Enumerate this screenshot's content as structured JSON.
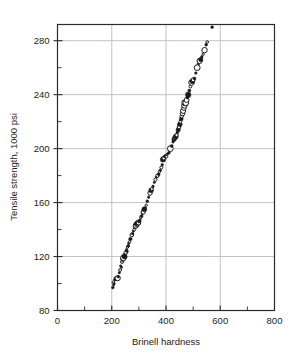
{
  "chart_data": {
    "type": "scatter",
    "title": "",
    "xlabel": "Brinell hardness",
    "ylabel": "Tensile strength, 1000 psi",
    "xlim": [
      0,
      800
    ],
    "ylim": [
      80,
      292
    ],
    "x_major_ticks": [
      0,
      200,
      400,
      600,
      800
    ],
    "x_tick_labels": [
      "0",
      "200",
      "400",
      "600",
      "800"
    ],
    "x_minor_step": 100,
    "y_major_ticks": [
      80,
      120,
      160,
      200,
      240,
      280
    ],
    "y_tick_labels": [
      "80",
      "120",
      "160",
      "200",
      "240",
      "280"
    ],
    "y_minor_step": 20,
    "grid": "major-both",
    "grid_color": "#b9bcc4",
    "frame_color": "#2b2b2b",
    "marker_color": "#1a1a1a",
    "legend": "none",
    "points": [
      {
        "x": 204,
        "y": 97,
        "r": 1.4,
        "filled": true
      },
      {
        "x": 207,
        "y": 99,
        "r": 1.2,
        "filled": true
      },
      {
        "x": 206,
        "y": 101,
        "r": 1.3,
        "filled": false
      },
      {
        "x": 209,
        "y": 100,
        "r": 1.1,
        "filled": true
      },
      {
        "x": 212,
        "y": 103,
        "r": 1.5,
        "filled": true
      },
      {
        "x": 214,
        "y": 104,
        "r": 1.2,
        "filled": false
      },
      {
        "x": 218,
        "y": 103,
        "r": 1.2,
        "filled": true
      },
      {
        "x": 222,
        "y": 104,
        "r": 2.6,
        "filled": false
      },
      {
        "x": 224,
        "y": 105,
        "r": 1.3,
        "filled": true
      },
      {
        "x": 228,
        "y": 108,
        "r": 1.2,
        "filled": true
      },
      {
        "x": 231,
        "y": 110,
        "r": 1.4,
        "filled": false
      },
      {
        "x": 233,
        "y": 113,
        "r": 1.2,
        "filled": true
      },
      {
        "x": 236,
        "y": 112,
        "r": 1.1,
        "filled": true
      },
      {
        "x": 238,
        "y": 116,
        "r": 1.5,
        "filled": false
      },
      {
        "x": 241,
        "y": 118,
        "r": 2.3,
        "filled": true
      },
      {
        "x": 243,
        "y": 119,
        "r": 2.8,
        "filled": false
      },
      {
        "x": 245,
        "y": 120,
        "r": 2.1,
        "filled": true
      },
      {
        "x": 246,
        "y": 121,
        "r": 1.6,
        "filled": false
      },
      {
        "x": 248,
        "y": 120,
        "r": 2.4,
        "filled": true
      },
      {
        "x": 250,
        "y": 122,
        "r": 1.3,
        "filled": true
      },
      {
        "x": 252,
        "y": 123,
        "r": 1.8,
        "filled": false
      },
      {
        "x": 254,
        "y": 125,
        "r": 1.2,
        "filled": true
      },
      {
        "x": 256,
        "y": 124,
        "r": 1.4,
        "filled": true
      },
      {
        "x": 258,
        "y": 127,
        "r": 1.2,
        "filled": false
      },
      {
        "x": 261,
        "y": 128,
        "r": 1.5,
        "filled": true
      },
      {
        "x": 263,
        "y": 130,
        "r": 1.3,
        "filled": true
      },
      {
        "x": 266,
        "y": 131,
        "r": 1.2,
        "filled": false
      },
      {
        "x": 268,
        "y": 133,
        "r": 1.6,
        "filled": true
      },
      {
        "x": 271,
        "y": 133,
        "r": 1.2,
        "filled": true
      },
      {
        "x": 274,
        "y": 136,
        "r": 1.8,
        "filled": false
      },
      {
        "x": 277,
        "y": 137,
        "r": 1.3,
        "filled": true
      },
      {
        "x": 280,
        "y": 139,
        "r": 1.2,
        "filled": true
      },
      {
        "x": 283,
        "y": 140,
        "r": 1.4,
        "filled": false
      },
      {
        "x": 286,
        "y": 142,
        "r": 2.0,
        "filled": true
      },
      {
        "x": 289,
        "y": 143,
        "r": 2.7,
        "filled": false
      },
      {
        "x": 291,
        "y": 144,
        "r": 2.4,
        "filled": true
      },
      {
        "x": 294,
        "y": 144,
        "r": 1.9,
        "filled": false
      },
      {
        "x": 296,
        "y": 145,
        "r": 2.6,
        "filled": true
      },
      {
        "x": 299,
        "y": 145,
        "r": 2.2,
        "filled": false
      },
      {
        "x": 301,
        "y": 146,
        "r": 1.6,
        "filled": true
      },
      {
        "x": 304,
        "y": 147,
        "r": 1.3,
        "filled": true
      },
      {
        "x": 307,
        "y": 149,
        "r": 1.2,
        "filled": false
      },
      {
        "x": 310,
        "y": 150,
        "r": 1.5,
        "filled": true
      },
      {
        "x": 313,
        "y": 152,
        "r": 1.2,
        "filled": true
      },
      {
        "x": 316,
        "y": 153,
        "r": 2.1,
        "filled": false
      },
      {
        "x": 320,
        "y": 155,
        "r": 2.5,
        "filled": true
      },
      {
        "x": 323,
        "y": 156,
        "r": 1.3,
        "filled": true
      },
      {
        "x": 327,
        "y": 158,
        "r": 1.2,
        "filled": false
      },
      {
        "x": 331,
        "y": 161,
        "r": 1.4,
        "filled": true
      },
      {
        "x": 336,
        "y": 164,
        "r": 1.2,
        "filled": true
      },
      {
        "x": 341,
        "y": 167,
        "r": 2.2,
        "filled": false
      },
      {
        "x": 345,
        "y": 169,
        "r": 2.4,
        "filled": true
      },
      {
        "x": 348,
        "y": 170,
        "r": 1.5,
        "filled": false
      },
      {
        "x": 352,
        "y": 172,
        "r": 1.3,
        "filled": true
      },
      {
        "x": 357,
        "y": 175,
        "r": 1.2,
        "filled": true
      },
      {
        "x": 361,
        "y": 177,
        "r": 1.6,
        "filled": false
      },
      {
        "x": 365,
        "y": 179,
        "r": 1.3,
        "filled": true
      },
      {
        "x": 369,
        "y": 180,
        "r": 1.7,
        "filled": false
      },
      {
        "x": 373,
        "y": 181,
        "r": 1.4,
        "filled": true
      },
      {
        "x": 376,
        "y": 183,
        "r": 1.3,
        "filled": false
      },
      {
        "x": 379,
        "y": 184,
        "r": 1.2,
        "filled": true
      },
      {
        "x": 383,
        "y": 186,
        "r": 1.5,
        "filled": false
      },
      {
        "x": 386,
        "y": 188,
        "r": 1.3,
        "filled": true
      },
      {
        "x": 389,
        "y": 192,
        "r": 2.7,
        "filled": true
      },
      {
        "x": 392,
        "y": 193,
        "r": 1.9,
        "filled": false
      },
      {
        "x": 395,
        "y": 194,
        "r": 1.4,
        "filled": true
      },
      {
        "x": 398,
        "y": 195,
        "r": 1.2,
        "filled": true
      },
      {
        "x": 402,
        "y": 194,
        "r": 1.3,
        "filled": false
      },
      {
        "x": 406,
        "y": 196,
        "r": 1.2,
        "filled": true
      },
      {
        "x": 411,
        "y": 197,
        "r": 1.4,
        "filled": true
      },
      {
        "x": 416,
        "y": 200,
        "r": 2.9,
        "filled": false
      },
      {
        "x": 421,
        "y": 202,
        "r": 1.5,
        "filled": true
      },
      {
        "x": 426,
        "y": 205,
        "r": 1.3,
        "filled": true
      },
      {
        "x": 430,
        "y": 207,
        "r": 2.3,
        "filled": true
      },
      {
        "x": 433,
        "y": 208,
        "r": 2.0,
        "filled": false
      },
      {
        "x": 436,
        "y": 209,
        "r": 2.5,
        "filled": true
      },
      {
        "x": 439,
        "y": 210,
        "r": 1.6,
        "filled": false
      },
      {
        "x": 442,
        "y": 212,
        "r": 1.4,
        "filled": true
      },
      {
        "x": 445,
        "y": 214,
        "r": 2.2,
        "filled": true
      },
      {
        "x": 448,
        "y": 216,
        "r": 1.8,
        "filled": false
      },
      {
        "x": 451,
        "y": 218,
        "r": 2.4,
        "filled": true
      },
      {
        "x": 453,
        "y": 220,
        "r": 1.5,
        "filled": false
      },
      {
        "x": 456,
        "y": 222,
        "r": 2.0,
        "filled": true
      },
      {
        "x": 458,
        "y": 224,
        "r": 1.7,
        "filled": false
      },
      {
        "x": 461,
        "y": 226,
        "r": 2.3,
        "filled": false
      },
      {
        "x": 463,
        "y": 228,
        "r": 2.6,
        "filled": false
      },
      {
        "x": 466,
        "y": 230,
        "r": 2.2,
        "filled": false
      },
      {
        "x": 468,
        "y": 232,
        "r": 2.8,
        "filled": false
      },
      {
        "x": 470,
        "y": 234,
        "r": 3.1,
        "filled": false
      },
      {
        "x": 473,
        "y": 234,
        "r": 2.9,
        "filled": false
      },
      {
        "x": 476,
        "y": 236,
        "r": 2.4,
        "filled": false
      },
      {
        "x": 479,
        "y": 238,
        "r": 1.6,
        "filled": true
      },
      {
        "x": 482,
        "y": 240,
        "r": 2.7,
        "filled": true
      },
      {
        "x": 486,
        "y": 243,
        "r": 1.5,
        "filled": true
      },
      {
        "x": 490,
        "y": 246,
        "r": 1.4,
        "filled": false
      },
      {
        "x": 494,
        "y": 249,
        "r": 2.8,
        "filled": false
      },
      {
        "x": 497,
        "y": 250,
        "r": 2.5,
        "filled": true
      },
      {
        "x": 500,
        "y": 251,
        "r": 2.0,
        "filled": false
      },
      {
        "x": 505,
        "y": 252,
        "r": 1.5,
        "filled": true
      },
      {
        "x": 510,
        "y": 256,
        "r": 1.3,
        "filled": true
      },
      {
        "x": 515,
        "y": 260,
        "r": 2.9,
        "filled": false
      },
      {
        "x": 520,
        "y": 263,
        "r": 1.4,
        "filled": true
      },
      {
        "x": 524,
        "y": 265,
        "r": 2.6,
        "filled": false
      },
      {
        "x": 528,
        "y": 266,
        "r": 2.2,
        "filled": true
      },
      {
        "x": 532,
        "y": 268,
        "r": 1.3,
        "filled": true
      },
      {
        "x": 537,
        "y": 270,
        "r": 1.2,
        "filled": false
      },
      {
        "x": 542,
        "y": 273,
        "r": 2.7,
        "filled": false
      },
      {
        "x": 548,
        "y": 277,
        "r": 1.4,
        "filled": true
      },
      {
        "x": 552,
        "y": 279,
        "r": 1.3,
        "filled": false
      },
      {
        "x": 570,
        "y": 290,
        "r": 1.4,
        "filled": true
      }
    ]
  }
}
